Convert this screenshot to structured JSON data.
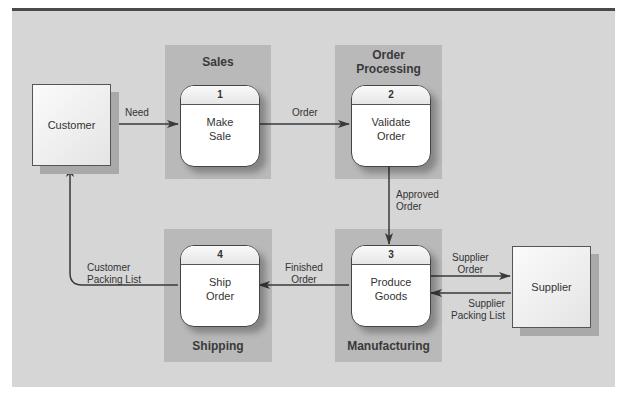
{
  "diagram": {
    "type": "data-flow-diagram",
    "colors": {
      "panel": "#d6d6d6",
      "lane": "#b9b9b9",
      "line": "#3a3a3a",
      "rule": "#4a4a4a"
    },
    "swimlanes": [
      {
        "id": "sales",
        "label": "Sales"
      },
      {
        "id": "order-processing",
        "label_line1": "Order",
        "label_line2": "Processing"
      },
      {
        "id": "manufacturing",
        "label": "Manufacturing"
      },
      {
        "id": "shipping",
        "label": "Shipping"
      }
    ],
    "entities": [
      {
        "id": "customer",
        "label": "Customer"
      },
      {
        "id": "supplier",
        "label": "Supplier"
      }
    ],
    "processes": [
      {
        "id": "1",
        "number": "1",
        "line1": "Make",
        "line2": "Sale"
      },
      {
        "id": "2",
        "number": "2",
        "line1": "Validate",
        "line2": "Order"
      },
      {
        "id": "3",
        "number": "3",
        "line1": "Produce",
        "line2": "Goods"
      },
      {
        "id": "4",
        "number": "4",
        "line1": "Ship",
        "line2": "Order"
      }
    ],
    "flows": [
      {
        "from": "customer",
        "to": "1",
        "line1": "Need"
      },
      {
        "from": "1",
        "to": "2",
        "line1": "Order"
      },
      {
        "from": "2",
        "to": "3",
        "line1": "Approved",
        "line2": "Order"
      },
      {
        "from": "3",
        "to": "supplier",
        "line1": "Supplier",
        "line2": "Order"
      },
      {
        "from": "supplier",
        "to": "3",
        "line1": "Supplier",
        "line2": "Packing List"
      },
      {
        "from": "3",
        "to": "4",
        "line1": "Finished",
        "line2": "Order"
      },
      {
        "from": "4",
        "to": "customer",
        "line1": "Customer",
        "line2": "Packing List"
      }
    ]
  }
}
